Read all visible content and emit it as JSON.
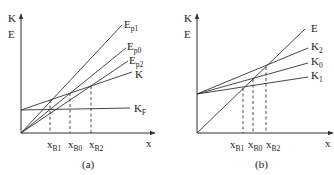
{
  "panels": [
    {
      "id": "a",
      "caption": "(a)",
      "y_axis_labels": [
        "K",
        "E"
      ],
      "x_axis_label": "x",
      "lines": [
        {
          "name": "E_p1",
          "main": "E",
          "sub": "p1"
        },
        {
          "name": "E_p0",
          "main": "E",
          "sub": "p0"
        },
        {
          "name": "E_p2",
          "main": "E",
          "sub": "p2"
        },
        {
          "name": "K",
          "main": "K",
          "sub": ""
        },
        {
          "name": "K_F",
          "main": "K",
          "sub": "F"
        }
      ],
      "x_ticks": [
        {
          "main": "x",
          "sub": "B1"
        },
        {
          "main": "x",
          "sub": "B0"
        },
        {
          "main": "x",
          "sub": "B2"
        }
      ]
    },
    {
      "id": "b",
      "caption": "(b)",
      "y_axis_labels": [
        "K",
        "E"
      ],
      "x_axis_label": "x",
      "lines": [
        {
          "name": "E",
          "main": "E",
          "sub": ""
        },
        {
          "name": "K_2",
          "main": "K",
          "sub": "2"
        },
        {
          "name": "K_0",
          "main": "K",
          "sub": "0"
        },
        {
          "name": "K_1",
          "main": "K",
          "sub": "1"
        }
      ],
      "x_ticks": [
        {
          "main": "x",
          "sub": "B1"
        },
        {
          "main": "x",
          "sub": "B0"
        },
        {
          "main": "x",
          "sub": "B2"
        }
      ]
    }
  ]
}
